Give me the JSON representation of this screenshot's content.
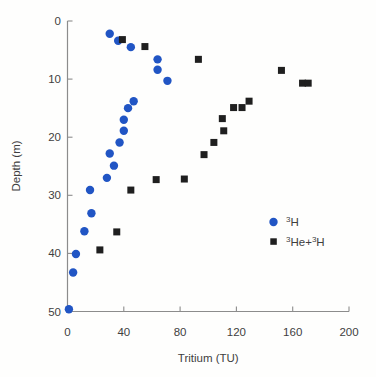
{
  "chart_data": {
    "type": "scatter",
    "title": "",
    "xlabel": "Tritium (TU)",
    "ylabel": "Depth (m)",
    "xlim": [
      0,
      200
    ],
    "ylim": [
      0,
      50
    ],
    "y_axis_inverted": true,
    "grid": false,
    "x_ticks": [
      0,
      40,
      80,
      120,
      160,
      200
    ],
    "y_ticks": [
      0,
      10,
      20,
      30,
      40,
      50
    ],
    "x_tick_labels": [
      "0",
      "40",
      "80",
      "120",
      "160",
      "200"
    ],
    "y_tick_labels": [
      "0",
      "10",
      "20",
      "30",
      "40",
      "50"
    ],
    "axis_color": "#8c8c8c",
    "text_color": "#3f3f3f",
    "legend_position": "inside-lower-right",
    "series": [
      {
        "name": "3H",
        "marker": "circle",
        "color": "#2155c4",
        "points": [
          [
            30,
            2.2
          ],
          [
            36,
            3.4
          ],
          [
            45,
            4.5
          ],
          [
            64,
            6.6
          ],
          [
            64,
            8.4
          ],
          [
            71,
            10.3
          ],
          [
            47,
            13.8
          ],
          [
            43,
            15.0
          ],
          [
            40,
            17.0
          ],
          [
            40,
            18.9
          ],
          [
            37,
            20.9
          ],
          [
            30,
            22.8
          ],
          [
            33,
            24.9
          ],
          [
            28,
            27.0
          ],
          [
            16,
            29.1
          ],
          [
            17,
            33.1
          ],
          [
            12,
            36.2
          ],
          [
            6,
            40.1
          ],
          [
            4,
            43.3
          ],
          [
            1,
            49.6
          ]
        ]
      },
      {
        "name": "3He+3H",
        "marker": "square",
        "color": "#1f1f1f",
        "points": [
          [
            39,
            3.2
          ],
          [
            55,
            4.4
          ],
          [
            93,
            6.6
          ],
          [
            152,
            8.5
          ],
          [
            167,
            10.7
          ],
          [
            171,
            10.7
          ],
          [
            129,
            13.8
          ],
          [
            118,
            14.9
          ],
          [
            124,
            14.9
          ],
          [
            110,
            16.8
          ],
          [
            111,
            18.9
          ],
          [
            104,
            20.9
          ],
          [
            97,
            23.0
          ],
          [
            63,
            27.3
          ],
          [
            83,
            27.2
          ],
          [
            45,
            29.1
          ],
          [
            35,
            36.3
          ],
          [
            23,
            39.4
          ]
        ]
      }
    ],
    "legend": {
      "items": [
        {
          "series": "3H",
          "marker": "circle",
          "color": "#2155c4",
          "label_plain": "3H",
          "parts": [
            {
              "t": "3",
              "sup": true
            },
            {
              "t": "H",
              "sup": false
            }
          ]
        },
        {
          "series": "3He+3H",
          "marker": "square",
          "color": "#1f1f1f",
          "label_plain": "3He+3H",
          "parts": [
            {
              "t": "3",
              "sup": true
            },
            {
              "t": "He+",
              "sup": false
            },
            {
              "t": "3",
              "sup": true
            },
            {
              "t": "H",
              "sup": false
            }
          ]
        }
      ]
    }
  }
}
